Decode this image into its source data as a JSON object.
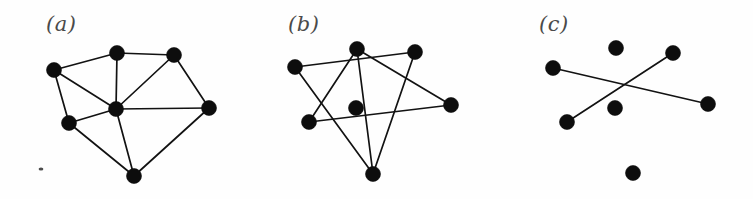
{
  "figure": {
    "width": 753,
    "height": 199,
    "background_color": "#fefefe",
    "node_color": "#0d0d0d",
    "edge_color": "#121212",
    "label_color": "#4a4a4a",
    "node_radius": 7.5,
    "edge_width": 1.7,
    "panel_count": 3
  },
  "panels": [
    {
      "id": "a",
      "label": "(a)",
      "label_x": 46,
      "label_y": 14,
      "origin_x": 0,
      "node_count": 7,
      "edge_count": 12,
      "nodes": [
        {
          "name": "left",
          "x": 54,
          "y": 70
        },
        {
          "name": "top",
          "x": 117,
          "y": 53
        },
        {
          "name": "top-right",
          "x": 174,
          "y": 55
        },
        {
          "name": "right",
          "x": 209,
          "y": 108
        },
        {
          "name": "center",
          "x": 116,
          "y": 109
        },
        {
          "name": "lower-left",
          "x": 69,
          "y": 123
        },
        {
          "name": "bottom",
          "x": 134,
          "y": 176
        }
      ],
      "edges": [
        [
          0,
          1
        ],
        [
          1,
          2
        ],
        [
          2,
          3
        ],
        [
          0,
          4
        ],
        [
          0,
          5
        ],
        [
          1,
          4
        ],
        [
          2,
          4
        ],
        [
          3,
          4
        ],
        [
          4,
          5
        ],
        [
          4,
          6
        ],
        [
          5,
          6
        ],
        [
          3,
          6
        ]
      ],
      "specks": [
        {
          "x": 41,
          "y": 169,
          "rx": 2.4,
          "ry": 1.6
        }
      ]
    },
    {
      "id": "b",
      "label": "(b)",
      "label_x": 288,
      "label_y": 14,
      "origin_x": 251,
      "node_count": 7,
      "edge_count": 7,
      "nodes": [
        {
          "name": "left",
          "x": 295,
          "y": 67
        },
        {
          "name": "top",
          "x": 357,
          "y": 49
        },
        {
          "name": "top-right",
          "x": 415,
          "y": 52
        },
        {
          "name": "right",
          "x": 451,
          "y": 105
        },
        {
          "name": "center",
          "x": 356,
          "y": 108
        },
        {
          "name": "lower-left",
          "x": 309,
          "y": 122
        },
        {
          "name": "bottom",
          "x": 373,
          "y": 174
        }
      ],
      "edges": [
        [
          0,
          2
        ],
        [
          0,
          6
        ],
        [
          1,
          5
        ],
        [
          1,
          6
        ],
        [
          1,
          3
        ],
        [
          2,
          6
        ],
        [
          5,
          3
        ]
      ],
      "specks": []
    },
    {
      "id": "c",
      "label": "(c)",
      "label_x": 539,
      "label_y": 14,
      "origin_x": 502,
      "node_count": 7,
      "edge_count": 2,
      "nodes": [
        {
          "name": "left",
          "x": 553,
          "y": 68
        },
        {
          "name": "top",
          "x": 616,
          "y": 48
        },
        {
          "name": "top-right",
          "x": 673,
          "y": 53
        },
        {
          "name": "right",
          "x": 708,
          "y": 104
        },
        {
          "name": "center",
          "x": 615,
          "y": 108
        },
        {
          "name": "lower-left",
          "x": 567,
          "y": 122
        },
        {
          "name": "bottom",
          "x": 633,
          "y": 173
        }
      ],
      "edges": [
        [
          0,
          3
        ],
        [
          5,
          2
        ]
      ],
      "specks": []
    }
  ]
}
